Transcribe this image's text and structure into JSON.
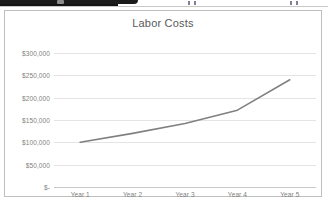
{
  "app_chrome": {
    "visible_fragment": "cropped-toolbar-edge"
  },
  "chart_card": {
    "title": "Labor Costs"
  },
  "chart_data": {
    "type": "line",
    "title": "Labor Costs",
    "xlabel": "",
    "ylabel": "",
    "categories": [
      "Year 1",
      "Year 2",
      "Year 3",
      "Year 4",
      "Year 5"
    ],
    "values": [
      100000,
      120000,
      142000,
      172000,
      240000
    ],
    "series": [
      {
        "name": "Labor Costs",
        "values": [
          100000,
          120000,
          142000,
          172000,
          240000
        ],
        "color": "#808080"
      }
    ],
    "ylim": [
      0,
      300000
    ],
    "ytick_values": [
      300000,
      250000,
      200000,
      150000,
      100000,
      50000,
      0
    ],
    "ytick_labels": [
      "$300,000",
      "$250,000",
      "$200,000",
      "$150,000",
      "$100,000",
      "$50,000",
      "$-"
    ],
    "grid": true,
    "legend": false,
    "markers": false,
    "line_color": "#808080",
    "grid_color": "#e4e4e4",
    "text_color": "#7f7f7f"
  }
}
